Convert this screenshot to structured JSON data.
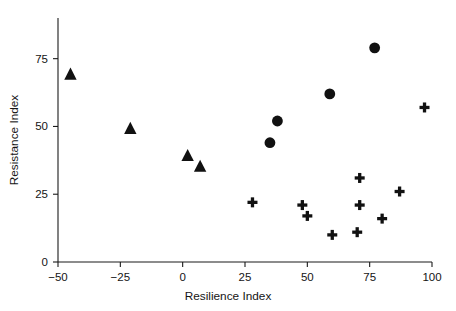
{
  "chart_data": {
    "type": "scatter",
    "title": "",
    "xlabel": "Resilience Index",
    "ylabel": "Resistance Index",
    "xlim": [
      -50,
      100
    ],
    "ylim": [
      0,
      90
    ],
    "xticks": [
      -50,
      -25,
      0,
      25,
      50,
      75,
      100
    ],
    "xtick_labels": [
      "−50",
      "−25",
      "0",
      "25",
      "50",
      "75",
      "100"
    ],
    "yticks": [
      0,
      25,
      50,
      75
    ],
    "ytick_labels": [
      "0",
      "25",
      "50",
      "75"
    ],
    "grid": false,
    "legend": "none",
    "series": [
      {
        "name": "triangle-group",
        "marker": "triangle",
        "color": "#111111",
        "points": [
          {
            "x": -45,
            "y": 69
          },
          {
            "x": -21,
            "y": 49
          },
          {
            "x": 2,
            "y": 39
          },
          {
            "x": 7,
            "y": 35
          }
        ]
      },
      {
        "name": "circle-group",
        "marker": "circle",
        "color": "#111111",
        "points": [
          {
            "x": 35,
            "y": 44
          },
          {
            "x": 38,
            "y": 52
          },
          {
            "x": 59,
            "y": 62
          },
          {
            "x": 77,
            "y": 79
          }
        ]
      },
      {
        "name": "plus-group",
        "marker": "plus",
        "color": "#111111",
        "points": [
          {
            "x": 28,
            "y": 22
          },
          {
            "x": 48,
            "y": 21
          },
          {
            "x": 50,
            "y": 17
          },
          {
            "x": 60,
            "y": 10
          },
          {
            "x": 70,
            "y": 11
          },
          {
            "x": 71,
            "y": 21
          },
          {
            "x": 71,
            "y": 31
          },
          {
            "x": 80,
            "y": 16
          },
          {
            "x": 87,
            "y": 26
          },
          {
            "x": 97,
            "y": 57
          }
        ]
      }
    ]
  },
  "axes": {
    "x_title": "Resilience Index",
    "y_title": "Resistance Index"
  }
}
